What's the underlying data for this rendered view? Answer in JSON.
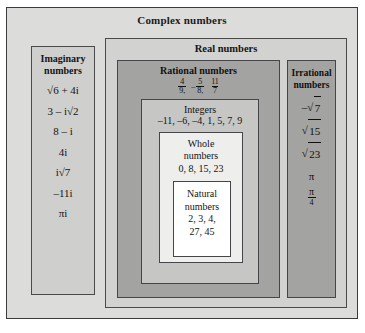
{
  "diagram": {
    "complex": {
      "label": "Complex numbers",
      "bg_color": "#dcdcda"
    },
    "imaginary": {
      "label_line1": "Imaginary",
      "label_line2": "numbers",
      "bg_color": "#cfcfcd",
      "items": [
        "√6 + 4i",
        "3 – i√2",
        "8 – i",
        "4i",
        "i√7",
        "–11i",
        "πi"
      ]
    },
    "real": {
      "label": "Real numbers",
      "bg_color": "#d2d2d0"
    },
    "rational": {
      "label": "Rational numbers",
      "bg_color": "#a3a3a1",
      "examples": [
        {
          "sign": "",
          "numerator": "4",
          "denominator": "9,"
        },
        {
          "sign": "–",
          "numerator": "5",
          "denominator": "8,"
        },
        {
          "sign": "",
          "numerator": "11",
          "denominator": "7"
        }
      ]
    },
    "integers": {
      "label": "Integers",
      "bg_color": "#c6c6c4",
      "values": "–11, –6, –4, 1, 5, 7, 9"
    },
    "whole": {
      "label_line1": "Whole",
      "label_line2": "numbers",
      "bg_color": "#eeeeec",
      "values": "0, 8, 15, 23"
    },
    "natural": {
      "label_line1": "Natural",
      "label_line2": "numbers",
      "bg_color": "#ffffff",
      "values_line1": "2, 3, 4,",
      "values_line2": "27, 45"
    },
    "irrational": {
      "label_line1": "Irrational",
      "label_line2": "numbers",
      "bg_color": "#a3a3a1",
      "items": [
        {
          "type": "text",
          "value": "–√7",
          "radical": "√",
          "radicand": "7",
          "prefix": "–"
        },
        {
          "type": "sqrt",
          "prefix": "",
          "radical": "√",
          "radicand": "15"
        },
        {
          "type": "sqrt",
          "prefix": "",
          "radical": "√",
          "radicand": "23"
        },
        {
          "type": "text",
          "value": "π"
        },
        {
          "type": "fraction",
          "numerator": "π",
          "denominator": "4"
        }
      ]
    }
  }
}
